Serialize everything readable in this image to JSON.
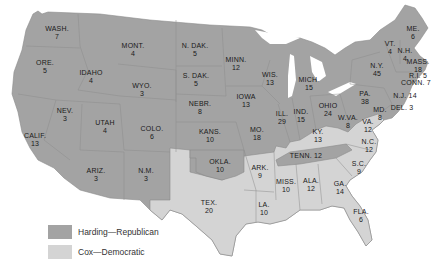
{
  "colors": {
    "republican": "#a3a3a3",
    "democratic": "#d4d4d4",
    "tenn_republican_dark": "#9a9a9a",
    "border": "#8c8c8c",
    "water": "#ffffff"
  },
  "legend": {
    "items": [
      {
        "label": "Harding—Republican",
        "color": "#a3a3a3"
      },
      {
        "label": "Cox—Democratic",
        "color": "#d4d4d4"
      }
    ]
  },
  "states": [
    {
      "abbr": "WASH.",
      "votes": "7",
      "party": "R",
      "x": 57,
      "y": 33
    },
    {
      "abbr": "ORE.",
      "votes": "5",
      "party": "R",
      "x": 45,
      "y": 67
    },
    {
      "abbr": "IDAHO",
      "votes": "4",
      "party": "R",
      "x": 91,
      "y": 77
    },
    {
      "abbr": "MONT.",
      "votes": "4",
      "party": "R",
      "x": 133,
      "y": 50
    },
    {
      "abbr": "WYO.",
      "votes": "3",
      "party": "R",
      "x": 142,
      "y": 90
    },
    {
      "abbr": "NEV.",
      "votes": "3",
      "party": "R",
      "x": 65,
      "y": 115
    },
    {
      "abbr": "CALIF.",
      "votes": "13",
      "party": "R",
      "x": 35,
      "y": 140
    },
    {
      "abbr": "UTAH",
      "votes": "4",
      "party": "R",
      "x": 105,
      "y": 127
    },
    {
      "abbr": "COLO.",
      "votes": "6",
      "party": "R",
      "x": 152,
      "y": 133
    },
    {
      "abbr": "ARIZ.",
      "votes": "3",
      "party": "R",
      "x": 96,
      "y": 175
    },
    {
      "abbr": "N.M.",
      "votes": "3",
      "party": "R",
      "x": 146,
      "y": 175
    },
    {
      "abbr": "N. DAK.",
      "votes": "5",
      "party": "R",
      "x": 195,
      "y": 50
    },
    {
      "abbr": "S. DAK.",
      "votes": "5",
      "party": "R",
      "x": 196,
      "y": 80
    },
    {
      "abbr": "NEBR.",
      "votes": "8",
      "party": "R",
      "x": 200,
      "y": 108
    },
    {
      "abbr": "KANS.",
      "votes": "10",
      "party": "R",
      "x": 210,
      "y": 136
    },
    {
      "abbr": "OKLA.",
      "votes": "10",
      "party": "R",
      "x": 220,
      "y": 166
    },
    {
      "abbr": "TEX.",
      "votes": "20",
      "party": "D",
      "x": 209,
      "y": 207
    },
    {
      "abbr": "MINN.",
      "votes": "12",
      "party": "R",
      "x": 236,
      "y": 64
    },
    {
      "abbr": "IOWA",
      "votes": "13",
      "party": "R",
      "x": 246,
      "y": 101
    },
    {
      "abbr": "MO.",
      "votes": "18",
      "party": "R",
      "x": 257,
      "y": 134
    },
    {
      "abbr": "ARK.",
      "votes": "9",
      "party": "D",
      "x": 260,
      "y": 172
    },
    {
      "abbr": "LA.",
      "votes": "10",
      "party": "D",
      "x": 264,
      "y": 209
    },
    {
      "abbr": "WIS.",
      "votes": "13",
      "party": "R",
      "x": 270,
      "y": 79
    },
    {
      "abbr": "ILL.",
      "votes": "29",
      "party": "R",
      "x": 282,
      "y": 118
    },
    {
      "abbr": "MICH.",
      "votes": "15",
      "party": "R",
      "x": 309,
      "y": 84
    },
    {
      "abbr": "IND.",
      "votes": "15",
      "party": "R",
      "x": 301,
      "y": 116
    },
    {
      "abbr": "OHIO",
      "votes": "24",
      "party": "R",
      "x": 328,
      "y": 110
    },
    {
      "abbr": "KY.",
      "votes": "13",
      "party": "D",
      "x": 318,
      "y": 136
    },
    {
      "abbr": "TENN.",
      "votes": "12",
      "party": "R",
      "x": 306,
      "y": 156
    },
    {
      "abbr": "MISS.",
      "votes": "10",
      "party": "D",
      "x": 286,
      "y": 186
    },
    {
      "abbr": "ALA.",
      "votes": "12",
      "party": "D",
      "x": 311,
      "y": 185
    },
    {
      "abbr": "GA.",
      "votes": "14",
      "party": "D",
      "x": 340,
      "y": 188
    },
    {
      "abbr": "FLA.",
      "votes": "6",
      "party": "D",
      "x": 361,
      "y": 216
    },
    {
      "abbr": "S.C.",
      "votes": "9",
      "party": "D",
      "x": 359,
      "y": 168
    },
    {
      "abbr": "N.C.",
      "votes": "12",
      "party": "D",
      "x": 369,
      "y": 146
    },
    {
      "abbr": "VA.",
      "votes": "12",
      "party": "D",
      "x": 368,
      "y": 126
    },
    {
      "abbr": "W.VA.",
      "votes": "8",
      "party": "R",
      "x": 348,
      "y": 122
    },
    {
      "abbr": "PA.",
      "votes": "38",
      "party": "R",
      "x": 365,
      "y": 98
    },
    {
      "abbr": "MD.",
      "votes": "8",
      "party": "R",
      "x": 380,
      "y": 114
    },
    {
      "abbr": "DEL.",
      "votes": "3",
      "party": "R",
      "x": 402,
      "y": 108
    },
    {
      "abbr": "N.J.",
      "votes": "14",
      "party": "R",
      "x": 405,
      "y": 96
    },
    {
      "abbr": "N.Y.",
      "votes": "45",
      "party": "R",
      "x": 377,
      "y": 70
    },
    {
      "abbr": "VT.",
      "votes": "4",
      "party": "R",
      "x": 390,
      "y": 48
    },
    {
      "abbr": "N.H.",
      "votes": "4",
      "party": "R",
      "x": 405,
      "y": 55
    },
    {
      "abbr": "ME.",
      "votes": "6",
      "party": "R",
      "x": 413,
      "y": 33
    },
    {
      "abbr": "MASS.",
      "votes": "18",
      "party": "R",
      "x": 418,
      "y": 66
    },
    {
      "abbr": "R.I.",
      "votes": "5",
      "party": "R",
      "x": 418,
      "y": 76
    },
    {
      "abbr": "CONN.",
      "votes": "7",
      "party": "R",
      "x": 416,
      "y": 83
    }
  ]
}
